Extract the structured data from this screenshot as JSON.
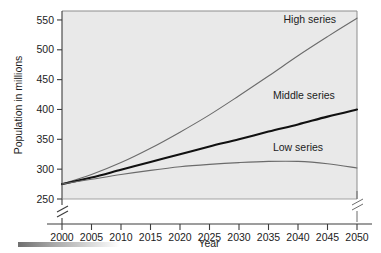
{
  "chart_data": {
    "type": "line",
    "title": "",
    "subtitle": "",
    "xlabel": "Year",
    "ylabel": "Population in millions",
    "xlim": [
      2000,
      2050
    ],
    "ylim": [
      250,
      565
    ],
    "ylim_break_below": 250,
    "grid": false,
    "legend_position": "inline-annotations",
    "x_tick_labels": [
      "2000",
      "2005",
      "2010",
      "2015",
      "2020",
      "2025",
      "2030",
      "2035",
      "2040",
      "2045",
      "2050"
    ],
    "y_tick_labels": [
      "250",
      "300",
      "350",
      "400",
      "450",
      "500",
      "550"
    ],
    "x": [
      2000,
      2005,
      2010,
      2015,
      2020,
      2025,
      2030,
      2035,
      2040,
      2045,
      2050
    ],
    "series": [
      {
        "name": "High series",
        "label": "High series",
        "color": "#6b6b6b",
        "values": [
          275,
          291,
          311,
          335,
          362,
          391,
          423,
          456,
          490,
          522,
          553
        ]
      },
      {
        "name": "Middle series",
        "label": "Middle series",
        "color": "#111111",
        "values": [
          275,
          286,
          299,
          312,
          325,
          338,
          350,
          363,
          375,
          388,
          400
        ]
      },
      {
        "name": "Low series",
        "label": "Low series",
        "color": "#6b6b6b",
        "values": [
          275,
          283,
          291,
          298,
          304,
          308,
          311,
          313,
          313,
          309,
          302
        ]
      }
    ],
    "annotations": [
      {
        "text": "High series",
        "x": 2042,
        "y": 545
      },
      {
        "text": "Middle series",
        "x": 2041,
        "y": 418
      },
      {
        "text": "Low series",
        "x": 2040,
        "y": 330
      }
    ],
    "axis_breaks": [
      "y-left-below-250",
      "y-right-below-250"
    ],
    "plot_background_color": "#e9e9e9",
    "figure_background_color": "#ffffff",
    "axis_color": "#5a5a5a"
  },
  "decoration": {
    "gradient_bar_present": true
  }
}
